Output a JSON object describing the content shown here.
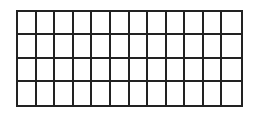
{
  "diagram": {
    "type": "grid",
    "rows": 4,
    "columns": 12,
    "line_color": "#222222",
    "fill_color": "#ffffff",
    "cells_filled": []
  }
}
